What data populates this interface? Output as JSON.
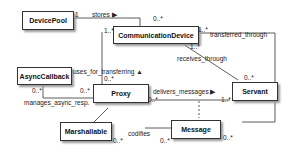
{
  "classes": {
    "device_pool": "DevicePool",
    "communication_device": "CommunicationDevice",
    "async_callback": "AsyncCallback",
    "proxy": "Proxy",
    "servant": "Servant",
    "marshallable": "Marshallable",
    "message": "Message"
  },
  "associations": {
    "stores": "stores ▶",
    "uses_for_transferring": "uses_for_transferring ▲",
    "transferred_through": "transferred_through",
    "receives_through": "receives_through",
    "delivers_messages": "delivers_messages ▶",
    "manages_async_resp": "manages_async_resp.",
    "codifies": "codifies"
  },
  "multiplicities": {
    "stores_src": "1",
    "stores_dst": "0..*",
    "cd_left": "1..*",
    "cd_right": "1..*",
    "cd_bottom": "1..*",
    "proxy_top": "0..*",
    "proxy_left": "0..*",
    "proxy_right": "0..*",
    "async": "0..*",
    "servant_top": "0..*",
    "servant_left": "1..*",
    "marsh": "0..*",
    "msg_left": "0..*",
    "msg_right": "0..*"
  }
}
